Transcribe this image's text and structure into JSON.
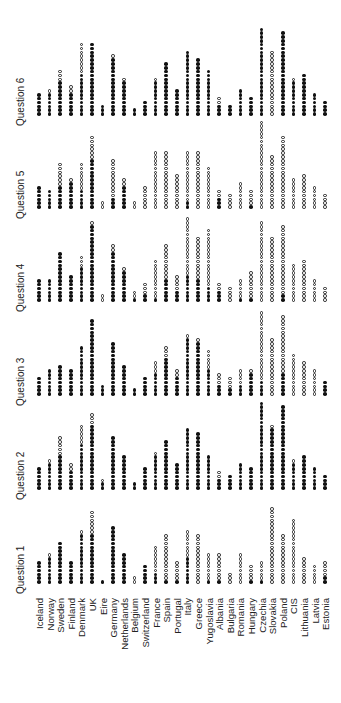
{
  "chart_data": {
    "type": "dot-column",
    "title": "",
    "xlabel": "",
    "ylabel": "",
    "legend": [
      {
        "symbol": "filled-circle",
        "meaning": "filled"
      },
      {
        "symbol": "open-circle",
        "meaning": "open"
      }
    ],
    "categories": [
      "Iceland",
      "Norway",
      "Sweden",
      "Finland",
      "Denmark",
      "UK",
      "Eire",
      "Germany",
      "Netherlands",
      "Belgium",
      "Switzerland",
      "France",
      "Spain",
      "Portugal",
      "Italy",
      "Greece",
      "Yugoslavia",
      "Albania",
      "Bulgaria",
      "Romania",
      "Hungary",
      "Czechia",
      "Slovakia",
      "Poland",
      "CIS",
      "Lithuania",
      "Latvia",
      "Estonia"
    ],
    "panels": [
      {
        "label": "Question 1",
        "filled": [
          6,
          7,
          11,
          6,
          13,
          13,
          1,
          15,
          8,
          0,
          5,
          3,
          1,
          1,
          7,
          0,
          1,
          1,
          0,
          0,
          1,
          1,
          0,
          0,
          0,
          0,
          0,
          2
        ],
        "open": [
          0,
          1,
          0,
          0,
          1,
          6,
          0,
          0,
          0,
          2,
          0,
          7,
          12,
          5,
          7,
          13,
          7,
          7,
          3,
          8,
          4,
          5,
          20,
          13,
          17,
          7,
          5,
          4
        ]
      },
      {
        "label": "Question 2",
        "filled": [
          6,
          7,
          9,
          5,
          12,
          17,
          2,
          14,
          9,
          2,
          6,
          9,
          13,
          7,
          16,
          15,
          9,
          3,
          4,
          7,
          6,
          23,
          16,
          22,
          7,
          9,
          6,
          4
        ],
        "open": [
          0,
          1,
          5,
          2,
          5,
          3,
          1,
          0,
          0,
          0,
          0,
          1,
          0,
          0,
          0,
          0,
          0,
          2,
          0,
          0,
          0,
          0,
          1,
          0,
          1,
          0,
          0,
          0
        ]
      },
      {
        "label": "Question 3",
        "filled": [
          5,
          7,
          8,
          7,
          13,
          20,
          3,
          14,
          8,
          2,
          5,
          6,
          10,
          5,
          15,
          14,
          7,
          3,
          2,
          3,
          6,
          4,
          0,
          6,
          0,
          0,
          0,
          4
        ],
        "open": [
          0,
          0,
          0,
          0,
          0,
          0,
          0,
          0,
          0,
          0,
          0,
          3,
          3,
          2,
          1,
          1,
          5,
          3,
          3,
          4,
          1,
          18,
          15,
          15,
          11,
          9,
          7,
          0
        ]
      },
      {
        "label": "Question 4",
        "filled": [
          6,
          6,
          13,
          7,
          9,
          20,
          0,
          13,
          8,
          1,
          2,
          1,
          6,
          3,
          7,
          6,
          4,
          3,
          0,
          1,
          1,
          0,
          0,
          2,
          0,
          0,
          0,
          0
        ],
        "open": [
          0,
          0,
          0,
          0,
          3,
          1,
          2,
          2,
          1,
          2,
          3,
          10,
          9,
          4,
          15,
          11,
          15,
          2,
          4,
          5,
          7,
          21,
          17,
          18,
          10,
          11,
          6,
          4
        ]
      },
      {
        "label": "Question 5",
        "filled": [
          6,
          5,
          6,
          7,
          5,
          13,
          0,
          3,
          6,
          0,
          0,
          0,
          0,
          0,
          2,
          0,
          0,
          3,
          0,
          0,
          1,
          0,
          0,
          0,
          0,
          0,
          0,
          0
        ],
        "open": [
          0,
          0,
          6,
          1,
          7,
          6,
          2,
          10,
          2,
          2,
          6,
          15,
          15,
          9,
          13,
          15,
          11,
          2,
          4,
          7,
          4,
          23,
          14,
          19,
          8,
          9,
          6,
          4
        ]
      },
      {
        "label": "Question 6",
        "filled": [
          6,
          6,
          9,
          6,
          11,
          19,
          3,
          15,
          9,
          2,
          4,
          9,
          14,
          7,
          17,
          15,
          12,
          3,
          3,
          7,
          5,
          23,
          0,
          22,
          9,
          11,
          6,
          4
        ],
        "open": [
          0,
          1,
          3,
          2,
          8,
          0,
          0,
          1,
          1,
          0,
          0,
          1,
          0,
          0,
          0,
          0,
          0,
          2,
          0,
          0,
          0,
          0,
          17,
          0,
          1,
          0,
          0,
          0
        ]
      }
    ]
  }
}
